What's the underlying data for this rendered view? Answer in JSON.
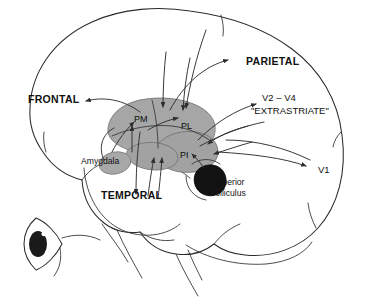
{
  "figure": {
    "type": "anatomical-diagram",
    "background_color": "#ffffff",
    "outline_color": "#2b2b2b",
    "nucleus_fill_color": "#a6a6a6",
    "colliculus_fill_color": "#131313"
  },
  "labels": {
    "frontal": "FRONTAL",
    "parietal": "PARIETAL",
    "temporal": "TEMPORAL",
    "amygdala": "Amygdala",
    "pulvinar_medial": "PM",
    "pulvinar_lateral": "PL",
    "pulvinar_inferior": "PI",
    "extrastriate_line1": "V2 – V4",
    "extrastriate_line2": "\"EXTRASTRIATE\"",
    "v1": "V1",
    "superior_colliculus_line1": "Superior",
    "superior_colliculus_line2": "Colliculus"
  },
  "structures": [
    {
      "name": "brain-outline",
      "fill": "none",
      "stroke": "#2b2b2b"
    },
    {
      "name": "pulvinar-medial",
      "label": "PM",
      "fill": "#a6a6a6"
    },
    {
      "name": "pulvinar-lateral",
      "label": "PL",
      "fill": "#a6a6a6"
    },
    {
      "name": "pulvinar-inferior",
      "label": "PI",
      "fill": "#a2a2a2"
    },
    {
      "name": "amygdala",
      "label": "Amygdala",
      "fill": "#a8a8a8"
    },
    {
      "name": "superior-colliculus",
      "label": "Superior Colliculus",
      "fill": "#131313"
    },
    {
      "name": "eye",
      "label": "eye",
      "fill": "#2a2a2a"
    }
  ],
  "connections": [
    {
      "from": "PM",
      "to": "FRONTAL"
    },
    {
      "from": "PL",
      "to": "PARIETAL"
    },
    {
      "from": "PM",
      "to": "TEMPORAL"
    },
    {
      "from": "PI",
      "to": "V2 – V4"
    },
    {
      "from": "PI",
      "to": "V1"
    },
    {
      "from": "Superior Colliculus",
      "to": "PI"
    },
    {
      "from": "Amygdala",
      "to": "PM"
    },
    {
      "from": "V1",
      "to": "PI"
    },
    {
      "from": "PARIETAL",
      "to": "PL"
    }
  ]
}
